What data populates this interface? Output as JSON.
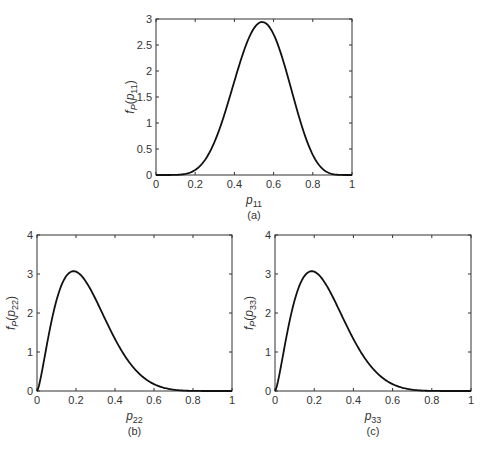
{
  "figure": {
    "background": "#ffffff",
    "line_color": "#111111",
    "caption_fragment": "(caption text cut off at bottom edge — illegible)"
  },
  "chart_data": [
    {
      "id": "a",
      "type": "line",
      "panel_label": "(a)",
      "title": "",
      "xlabel": "p11",
      "ylabel": "fP(p11)",
      "xlim": [
        0,
        1
      ],
      "ylim": [
        0,
        3
      ],
      "xticks": [
        0,
        0.2,
        0.4,
        0.6,
        0.8,
        1
      ],
      "xtick_labels": [
        "0",
        "0.2",
        "0.4",
        "0.6",
        "0.8",
        "1"
      ],
      "yticks": [
        0,
        0.5,
        1,
        1.5,
        2,
        2.5,
        3
      ],
      "ytick_labels": [
        "0",
        "0.5",
        "1",
        "1.5",
        "2",
        "2.5",
        "3"
      ],
      "grid": false,
      "legend": null,
      "distribution": {
        "kind": "beta",
        "alpha": 7.5,
        "beta": 6.5
      },
      "peak": {
        "x": 0.54,
        "y": 2.83
      },
      "box": {
        "x0": 156,
        "y0": 19,
        "x1": 352,
        "y1": 175
      },
      "series": [
        {
          "name": "fP(p11)",
          "x": [
            0,
            0.1,
            0.2,
            0.3,
            0.4,
            0.5,
            0.54,
            0.6,
            0.7,
            0.8,
            0.9,
            1
          ],
          "y": [
            0,
            0.01,
            0.12,
            0.66,
            1.75,
            2.72,
            2.83,
            2.62,
            1.6,
            0.46,
            0.03,
            0
          ]
        }
      ]
    },
    {
      "id": "b",
      "type": "line",
      "panel_label": "(b)",
      "title": "",
      "xlabel": "p22",
      "ylabel": "fP(p22)",
      "xlim": [
        0,
        1
      ],
      "ylim": [
        0,
        4
      ],
      "xticks": [
        0,
        0.2,
        0.4,
        0.6,
        0.8,
        1
      ],
      "xtick_labels": [
        "0",
        "0.2",
        "0.4",
        "0.6",
        "0.8",
        "1"
      ],
      "yticks": [
        0,
        1,
        2,
        3,
        4
      ],
      "ytick_labels": [
        "0",
        "1",
        "2",
        "3",
        "4"
      ],
      "grid": false,
      "legend": null,
      "distribution": {
        "kind": "beta",
        "alpha": 2.5,
        "beta": 7.5
      },
      "peak": {
        "x": 0.18,
        "y": 3.58
      },
      "box": {
        "x0": 37,
        "y0": 235,
        "x1": 232,
        "y1": 391
      },
      "series": [
        {
          "name": "fP(p22)",
          "x": [
            0,
            0.05,
            0.1,
            0.18,
            0.2,
            0.3,
            0.4,
            0.5,
            0.6,
            0.7,
            0.8,
            1
          ],
          "y": [
            0,
            1.5,
            2.9,
            3.58,
            3.55,
            2.6,
            1.3,
            0.45,
            0.1,
            0.01,
            0,
            0
          ]
        }
      ]
    },
    {
      "id": "c",
      "type": "line",
      "panel_label": "(c)",
      "title": "",
      "xlabel": "p33",
      "ylabel": "fP(p33)",
      "xlim": [
        0,
        1
      ],
      "ylim": [
        0,
        4
      ],
      "xticks": [
        0,
        0.2,
        0.4,
        0.6,
        0.8,
        1
      ],
      "xtick_labels": [
        "0",
        "0.2",
        "0.4",
        "0.6",
        "0.8",
        "1"
      ],
      "yticks": [
        0,
        1,
        2,
        3,
        4
      ],
      "ytick_labels": [
        "0",
        "1",
        "2",
        "3",
        "4"
      ],
      "grid": false,
      "legend": null,
      "distribution": {
        "kind": "beta",
        "alpha": 2.5,
        "beta": 7.5
      },
      "peak": {
        "x": 0.18,
        "y": 3.58
      },
      "box": {
        "x0": 275,
        "y0": 235,
        "x1": 471,
        "y1": 391
      },
      "series": [
        {
          "name": "fP(p33)",
          "x": [
            0,
            0.05,
            0.1,
            0.18,
            0.2,
            0.3,
            0.4,
            0.5,
            0.6,
            0.7,
            0.8,
            1
          ],
          "y": [
            0,
            1.5,
            2.9,
            3.58,
            3.55,
            2.6,
            1.3,
            0.45,
            0.1,
            0.01,
            0,
            0
          ]
        }
      ]
    }
  ]
}
